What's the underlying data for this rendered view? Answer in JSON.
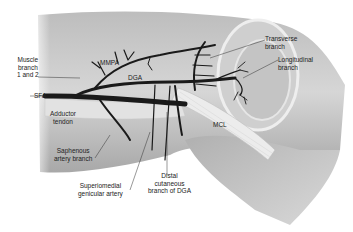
{
  "figure": {
    "labels": {
      "muscle_branch": [
        "Muscle",
        "branch",
        "1 and 2"
      ],
      "mmpa": "MMPA",
      "dga": "DGA",
      "sfa": "SFA",
      "adductor_tendon": [
        "Adductor",
        "tendon"
      ],
      "saphenous_artery_branch": [
        "Saphenous",
        "artery branch"
      ],
      "superomedial_genicular_artery": [
        "Superiomedial",
        "genicular artery"
      ],
      "distal_cutaneous_branch": [
        "Distal",
        "cutaneous",
        "branch of DGA"
      ],
      "mcl": "MCL",
      "transverse_branch": [
        "Transverse",
        "branch"
      ],
      "longitudinal_branch": [
        "Longitudinal",
        "branch"
      ]
    },
    "colors": {
      "background": "#ffffff",
      "skin_light": "#d9d9d9",
      "skin_dark": "#9a9a9a",
      "vessel": "#1a1a1a",
      "ligament": "#e8e8e8",
      "leader_line": "#333333"
    }
  }
}
